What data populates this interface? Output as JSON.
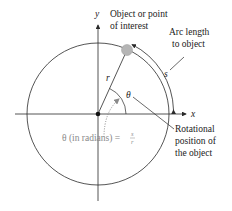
{
  "diagram": {
    "axes": {
      "x_label": "x",
      "y_label": "y"
    },
    "point_label": {
      "line1": "Object or point",
      "line2": "of interest"
    },
    "arc_label": {
      "line1": "Arc length",
      "line2": "to object",
      "symbol": "s"
    },
    "radius_label": "r",
    "angle_label": "θ",
    "rotation_label": {
      "line1": "Rotational",
      "line2": "position of",
      "line3": "the object"
    },
    "formula": {
      "lhs": "θ (in radians) = ",
      "num": "s",
      "den": "r"
    },
    "colors": {
      "line": "#2a2a2a",
      "object": "#b5b5b5",
      "formula": "#8a8a8a"
    }
  }
}
